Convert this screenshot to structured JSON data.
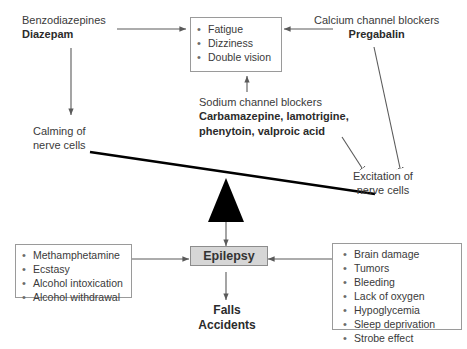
{
  "diagram": {
    "colors": {
      "text": "#3a3a3a",
      "box_border": "#9a9a9a",
      "arrow": "#5a5a5a",
      "beam": "#000000",
      "fulcrum": "#000000",
      "epilepsy_fill": "#d6d6d6"
    }
  },
  "benzodiazepines": {
    "line1": "Benzodiazepines",
    "line2": "Diazepam"
  },
  "calcium_blockers": {
    "line1": "Calcium channel blockers",
    "line2": "Pregabalin"
  },
  "sodium_blockers": {
    "line1": "Sodium channel blockers",
    "line2": "Carbamazepine, lamotrigine,",
    "line3": "phenytoin, valproic acid"
  },
  "side_effects_box": {
    "items": [
      "Fatigue",
      "Dizziness",
      "Double vision"
    ]
  },
  "calming": {
    "line1": "Calming of",
    "line2": "nerve cells"
  },
  "excitation": {
    "line1": "Excitation of",
    "line2": "nerve cells"
  },
  "epilepsy": {
    "label": "Epilepsy"
  },
  "falls_accidents": {
    "line1": "Falls",
    "line2": "Accidents"
  },
  "left_causes_box": {
    "items": [
      "Methamphetamine",
      "Ecstasy",
      "Alcohol intoxication",
      "Alcohol withdrawal"
    ]
  },
  "right_causes_box": {
    "items": [
      "Brain damage",
      "Tumors",
      "Bleeding",
      "Lack of oxygen",
      "Hypoglycemia",
      "Sleep deprivation",
      "Strobe effect"
    ]
  },
  "bullet_glyph": "•"
}
